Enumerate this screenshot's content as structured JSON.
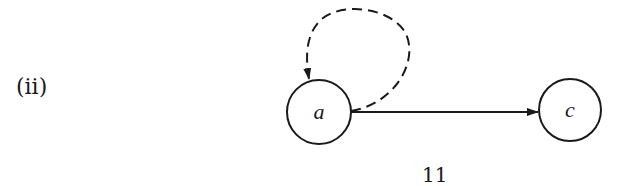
{
  "figure": {
    "part_label": "(ii)",
    "page_number": "11"
  },
  "nodes": [
    {
      "id": "a",
      "label": "a",
      "cx": 319,
      "cy": 112,
      "r": 32
    },
    {
      "id": "c",
      "label": "c",
      "cx": 570,
      "cy": 110,
      "r": 31
    }
  ],
  "edges": [
    {
      "from": "a",
      "to": "a",
      "style": "dashed",
      "type": "self-loop"
    },
    {
      "from": "a",
      "to": "c",
      "style": "solid",
      "type": "directed"
    }
  ],
  "colors": {
    "stroke": "#1a1a1a",
    "background": "#ffffff"
  }
}
